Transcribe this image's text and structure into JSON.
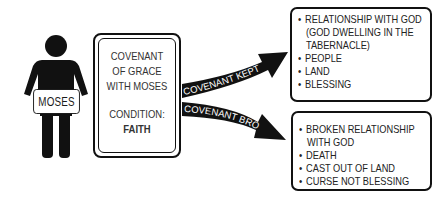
{
  "person": {
    "sign_label": "MOSES"
  },
  "covenant_box": {
    "title_lines": [
      "COVENANT",
      "OF GRACE",
      "WITH MOSES"
    ],
    "condition_label": "CONDITION:",
    "condition_value": "FAITH"
  },
  "arrows": {
    "kept_label": "COVENANT KEPT",
    "broken_label": "COVENANT BROKEN"
  },
  "outcome_kept": {
    "items": [
      "RELATIONSHIP WITH GOD",
      "(GOD DWELLING IN THE",
      "TABERNACLE)",
      "PEOPLE",
      "LAND",
      "BLESSING"
    ]
  },
  "outcome_broken": {
    "items": [
      "BROKEN RELATIONSHIP",
      "WITH GOD",
      "DEATH",
      "CAST OUT OF LAND",
      "CURSE NOT BLESSING"
    ]
  },
  "colors": {
    "ink": "#111111",
    "background": "#ffffff"
  }
}
